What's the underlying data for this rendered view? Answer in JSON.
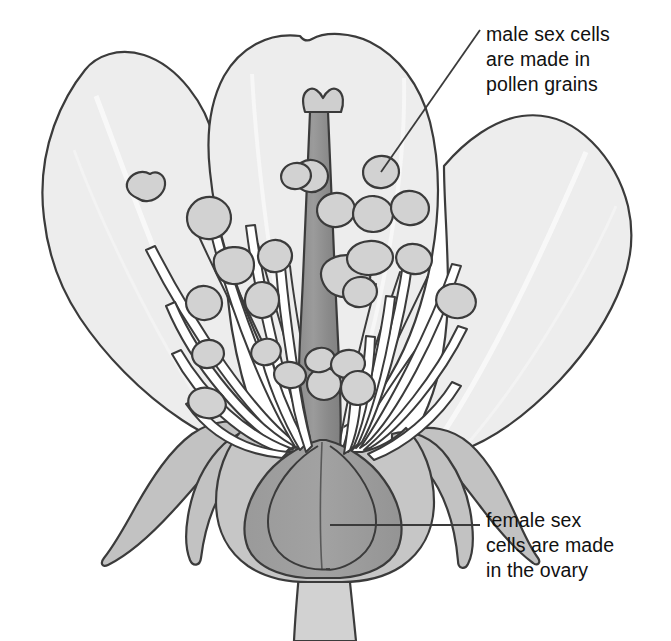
{
  "figure": {
    "background_color": "#ffffff",
    "outline_color": "#3b3b3b",
    "width": 671,
    "height": 641
  },
  "annotations": [
    {
      "id": "male",
      "name": "male-sex-cells-label",
      "lines": [
        "male sex cells",
        "are made in",
        "pollen grains"
      ],
      "text": "male sex cells are made in pollen grains",
      "leader": {
        "from_x": 480,
        "from_y": 30,
        "to_x": 381,
        "to_y": 172,
        "color": "#3b3b3b"
      },
      "points_to": "anther"
    },
    {
      "id": "female",
      "name": "female-sex-cells-label",
      "lines": [
        "female sex",
        "cells are made",
        "in the ovary"
      ],
      "text": "female sex cells are made in the ovary",
      "leader": {
        "from_x": 480,
        "from_y": 525,
        "to_x": 330,
        "to_y": 525,
        "color": "#3b3b3b"
      },
      "points_to": "ovary"
    }
  ],
  "parts": {
    "petals": {
      "name": "petals",
      "count": 3,
      "fill": "#ededed",
      "stroke": "#3b3b3b",
      "vein_color": "#f7f7f7"
    },
    "sepals": {
      "name": "sepals",
      "count": 4,
      "fill": "#c2c2c2",
      "stroke": "#3b3b3b"
    },
    "stamens": {
      "name": "stamens",
      "count": 26,
      "filament_fill": "#ffffff",
      "filament_stroke": "#3b3b3b",
      "anther_fill": "#d2d2d2",
      "anther_stroke": "#3b3b3b"
    },
    "style": {
      "name": "style",
      "fill": "#949494",
      "stroke": "#3b3b3b"
    },
    "stigma": {
      "name": "stigma",
      "fill": "#cfcfcf",
      "stroke": "#3b3b3b"
    },
    "ovary": {
      "name": "ovary",
      "fill": "#9b9b9b",
      "stroke": "#3b3b3b"
    },
    "receptacle": {
      "name": "receptacle",
      "fill": "#c6c6c6",
      "stroke": "#3b3b3b"
    },
    "stem": {
      "name": "stem",
      "fill": "#d2d2d2",
      "stroke": "#3b3b3b"
    }
  }
}
